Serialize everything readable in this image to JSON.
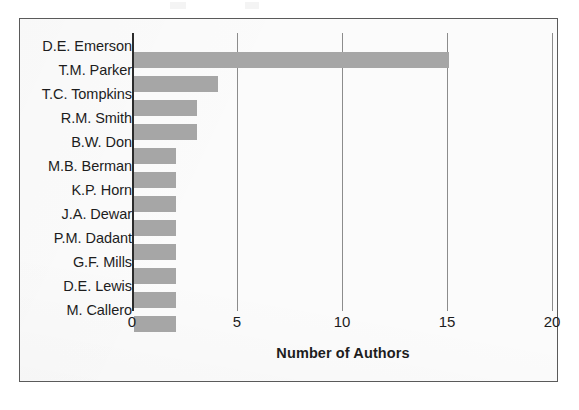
{
  "chart_data": {
    "type": "bar",
    "orientation": "horizontal",
    "title": "",
    "subtitle": "",
    "xlabel": "Number of Authors",
    "ylabel": "",
    "categories": [
      "D.E. Emerson",
      "T.M. Parker",
      "T.C. Tompkins",
      "R.M. Smith",
      "B.W. Don",
      "M.B. Berman",
      "K.P. Horn",
      "J.A. Dewar",
      "P.M. Dadant",
      "G.F. Mills",
      "D.E. Lewis",
      "M. Callero"
    ],
    "values": [
      15,
      4,
      3,
      3,
      2,
      2,
      2,
      2,
      2,
      2,
      2,
      2
    ],
    "xlim": [
      0,
      20
    ],
    "xticks": [
      0,
      5,
      10,
      15,
      20
    ],
    "xtick_labels": [
      "0",
      "5",
      "10",
      "15",
      "20"
    ],
    "grid": "vertical",
    "legend": "none",
    "bar_color": "#a6a6a6",
    "gridline_color": "#8c8c8c",
    "axis_color": "#2b2b2b",
    "text_color": "#1d1d1d",
    "frame_color": "#5a5a5a",
    "background_color": "#fbfbfb"
  }
}
